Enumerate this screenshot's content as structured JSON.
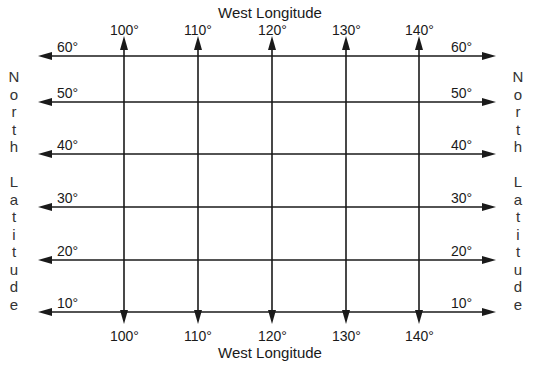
{
  "diagram": {
    "top_axis_title": "West Longitude",
    "bottom_axis_title": "West Longitude",
    "left_axis_title": "North Latitude",
    "right_axis_title": "North Latitude",
    "longitudes": [
      {
        "label": "100°",
        "x": 124
      },
      {
        "label": "110°",
        "x": 198
      },
      {
        "label": "120°",
        "x": 272
      },
      {
        "label": "130°",
        "x": 346
      },
      {
        "label": "140°",
        "x": 419
      }
    ],
    "latitudes": [
      {
        "label": "60°",
        "y": 56
      },
      {
        "label": "50°",
        "y": 102
      },
      {
        "label": "40°",
        "y": 154
      },
      {
        "label": "30°",
        "y": 207
      },
      {
        "label": "20°",
        "y": 260
      },
      {
        "label": "10°",
        "y": 312
      }
    ],
    "line_color": "#1a1a1a",
    "background": "#ffffff"
  }
}
